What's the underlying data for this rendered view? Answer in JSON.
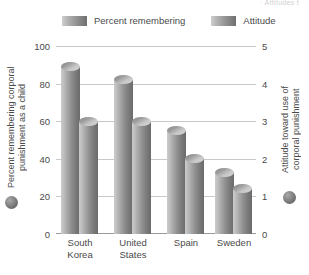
{
  "topnote": "·  Attitudes t",
  "legend": {
    "items": [
      {
        "label": "Percent remembering",
        "key": "percent_remembering"
      },
      {
        "label": "Attitude",
        "key": "attitude"
      }
    ]
  },
  "axes": {
    "left": {
      "title": "Percent remembering corporal\npunishment as a child",
      "ticks": [
        "100",
        "80",
        "60",
        "40",
        "20",
        "0"
      ],
      "min": 0,
      "max": 100
    },
    "right": {
      "title": "Attitude toward use of\ncorporal punishment",
      "ticks": [
        "5",
        "4",
        "3",
        "2",
        "1",
        "0"
      ],
      "min": 0,
      "max": 5
    }
  },
  "categories": [
    "South\nKorea",
    "United\nStates",
    "Spain",
    "Sweden"
  ],
  "chart_data": {
    "type": "bar",
    "title": "",
    "subtitle": "",
    "categories": [
      "South Korea",
      "United States",
      "Spain",
      "Sweden"
    ],
    "series": [
      {
        "name": "Percent remembering",
        "axis": "left",
        "unit": "percent",
        "values": [
          89,
          82,
          55,
          33
        ]
      },
      {
        "name": "Attitude",
        "axis": "right",
        "unit": "rating",
        "values": [
          3.0,
          3.0,
          2.0,
          1.2
        ]
      }
    ],
    "xlabel": "",
    "ylabel": "Percent remembering corporal punishment as a child",
    "ylabel_right": "Attitude toward use of corporal punishment",
    "ylim": [
      0,
      100
    ],
    "ylim_right": [
      0,
      5
    ],
    "grid": true,
    "legend_position": "top",
    "colors": {
      "bar_light": "#cbcbcb",
      "bar_dark": "#6a6a6a",
      "gridline": "#c9c9c9",
      "text": "#4a4a4a"
    }
  }
}
